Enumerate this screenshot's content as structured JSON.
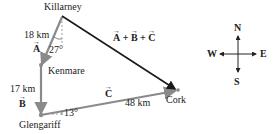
{
  "places": {
    "killarney": "Killarney",
    "kenmare": "Kenmare",
    "glengariff": "Glengariff",
    "cork": "Cork"
  },
  "vectors": {
    "a": {
      "distance": "18 km",
      "symbol": "A",
      "angle": "27°"
    },
    "b": {
      "distance": "17 km",
      "symbol": "B"
    },
    "c": {
      "distance": "48 km",
      "symbol": "C",
      "angle": "13°"
    },
    "sum": {
      "a": "A",
      "plus1": " + ",
      "b": "B",
      "plus2": " + ",
      "c": "C"
    }
  },
  "compass": {
    "n": "N",
    "s": "S",
    "e": "E",
    "w": "W"
  },
  "colors": {
    "component_vectors": "#8a8a8a",
    "resultant": "#1a1a1a"
  }
}
